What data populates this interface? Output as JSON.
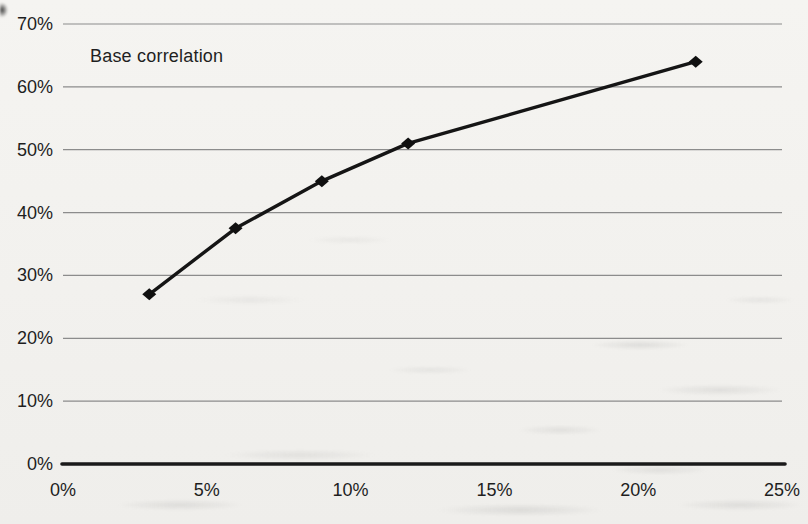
{
  "chart_data": {
    "type": "line",
    "title": "",
    "annotation": "Base correlation",
    "series": [
      {
        "name": "Base correlation",
        "x": [
          3,
          6,
          9,
          12,
          22
        ],
        "y": [
          27,
          37.5,
          45,
          51,
          64
        ]
      }
    ],
    "xlabel": "",
    "ylabel": "",
    "xlim": [
      0,
      25
    ],
    "ylim": [
      0,
      70
    ],
    "x_ticks": [
      0,
      5,
      10,
      15,
      20,
      25
    ],
    "y_ticks": [
      0,
      10,
      20,
      30,
      40,
      50,
      60,
      70
    ],
    "x_tick_labels": [
      "0%",
      "5%",
      "10%",
      "15%",
      "20%",
      "25%"
    ],
    "y_tick_labels": [
      "0%",
      "10%",
      "20%",
      "30%",
      "40%",
      "50%",
      "60%",
      "70%"
    ],
    "grid": "horizontal",
    "legend": "none",
    "marker": "diamond",
    "colors": {
      "line": "#151515",
      "marker": "#101010",
      "gridline": "#8c8c8c",
      "axis": "#1a1a1a",
      "text": "#1e1e1e",
      "background": "#f3f2ef"
    }
  }
}
